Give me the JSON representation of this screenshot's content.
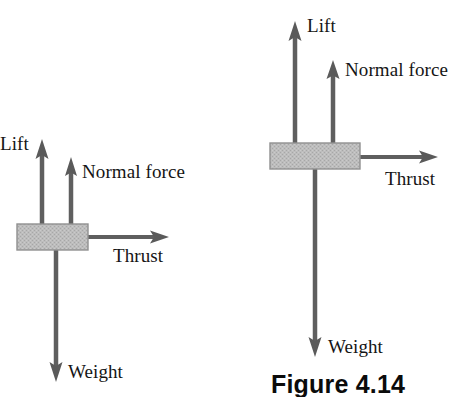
{
  "figure": {
    "caption": "Figure 4.14",
    "caption_x": 271,
    "caption_y": 372
  },
  "colors": {
    "background": "#ffffff",
    "arrow": "#5f5f5f",
    "arrow_dark": "#4a4a4a",
    "box_fill": "#b9b9b9",
    "box_stroke": "#8e8e8e",
    "text": "#151515",
    "caption_text": "#0b0b0b"
  },
  "diagrams": [
    {
      "name": "level-flight-diagram",
      "box": {
        "x": 17,
        "y": 224,
        "width": 71,
        "height": 26
      },
      "forces": [
        {
          "key": "lift",
          "label": "Lift",
          "direction": "up",
          "shaft_x": 42,
          "from_y": 224,
          "to_y": 140,
          "label_x": 0,
          "label_y": 134
        },
        {
          "key": "normal_force",
          "label": "Normal force",
          "direction": "up",
          "shaft_x": 71,
          "from_y": 224,
          "to_y": 158,
          "label_x": 82,
          "label_y": 162
        },
        {
          "key": "thrust",
          "label": "Thrust",
          "direction": "right",
          "shaft_y": 237,
          "from_x": 88,
          "to_x": 169,
          "label_x": 113,
          "label_y": 246
        },
        {
          "key": "weight",
          "label": "Weight",
          "direction": "down",
          "shaft_x": 56,
          "from_y": 250,
          "to_y": 381,
          "label_x": 68,
          "label_y": 362
        }
      ]
    },
    {
      "name": "climbing-flight-diagram",
      "box": {
        "x": 270,
        "y": 143,
        "width": 90,
        "height": 26
      },
      "forces": [
        {
          "key": "lift",
          "label": "Lift",
          "direction": "up",
          "shaft_x": 295,
          "from_y": 143,
          "to_y": 21,
          "label_x": 307,
          "label_y": 16
        },
        {
          "key": "normal_force",
          "label": "Normal force",
          "direction": "up",
          "shaft_x": 333,
          "from_y": 143,
          "to_y": 60,
          "label_x": 345,
          "label_y": 60
        },
        {
          "key": "thrust",
          "label": "Thrust",
          "direction": "right",
          "shaft_y": 157,
          "from_x": 360,
          "to_x": 438,
          "label_x": 385,
          "label_y": 169
        },
        {
          "key": "weight",
          "label": "Weight",
          "direction": "down",
          "shaft_x": 315,
          "from_y": 169,
          "to_y": 356,
          "label_x": 328,
          "label_y": 337
        }
      ]
    }
  ]
}
